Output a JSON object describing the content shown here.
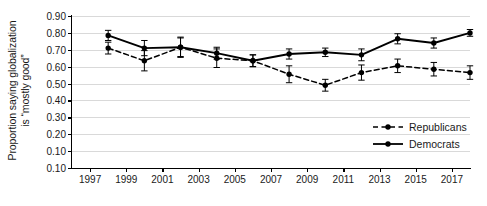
{
  "chart_data": {
    "type": "line",
    "title": "",
    "xlabel": "",
    "ylabel": "Proportion saying globalization is “mostly good”",
    "ylabel_line1": "Proportion saying globalization",
    "ylabel_line2": "is “mostly good”",
    "x": [
      1998,
      2000,
      2002,
      2004,
      2006,
      2008,
      2010,
      2012,
      2014,
      2016,
      2018
    ],
    "xlim": [
      1996,
      2018
    ],
    "ylim": [
      0.0,
      0.9
    ],
    "grid": true,
    "legend_position": "bottom-right",
    "xticks": [
      "1997",
      "1999",
      "2001",
      "2003",
      "2005",
      "2007",
      "2009",
      "2011",
      "2013",
      "2015",
      "2017"
    ],
    "xtick_values": [
      1997,
      1999,
      2001,
      2003,
      2005,
      2007,
      2009,
      2011,
      2013,
      2015,
      2017
    ],
    "yticks": [
      "0.90",
      "0.80",
      "0.70",
      "0.60",
      "0.50",
      "0.40",
      "0.30",
      "0.20",
      "0.10",
      "0.10"
    ],
    "ytick_values": [
      0.9,
      0.8,
      0.7,
      0.6,
      0.5,
      0.4,
      0.3,
      0.2,
      0.1,
      0.0
    ],
    "series": [
      {
        "name": "Republicans",
        "style": "dashed",
        "marker": "filled-circle",
        "color": "#000000",
        "values": [
          0.71,
          0.635,
          0.715,
          0.65,
          0.635,
          0.555,
          0.49,
          0.565,
          0.605,
          0.585,
          0.565
        ],
        "err_low": [
          0.675,
          0.575,
          0.655,
          0.595,
          0.6,
          0.505,
          0.455,
          0.52,
          0.565,
          0.545,
          0.525
        ],
        "err_high": [
          0.745,
          0.695,
          0.775,
          0.705,
          0.67,
          0.605,
          0.525,
          0.61,
          0.645,
          0.625,
          0.605
        ]
      },
      {
        "name": "Democrats",
        "style": "solid",
        "marker": "filled-circle",
        "color": "#000000",
        "values": [
          0.785,
          0.71,
          0.715,
          0.68,
          0.635,
          0.675,
          0.685,
          0.67,
          0.765,
          0.74,
          0.8
        ],
        "err_low": [
          0.755,
          0.665,
          0.66,
          0.645,
          0.6,
          0.645,
          0.66,
          0.635,
          0.735,
          0.71,
          0.78
        ],
        "err_high": [
          0.815,
          0.755,
          0.77,
          0.715,
          0.67,
          0.705,
          0.71,
          0.705,
          0.795,
          0.77,
          0.82
        ]
      }
    ],
    "legend": [
      {
        "label": "Republicans",
        "style": "dashed",
        "marker": "filled-circle"
      },
      {
        "label": "Democrats",
        "style": "solid",
        "marker": "filled-circle"
      }
    ]
  }
}
